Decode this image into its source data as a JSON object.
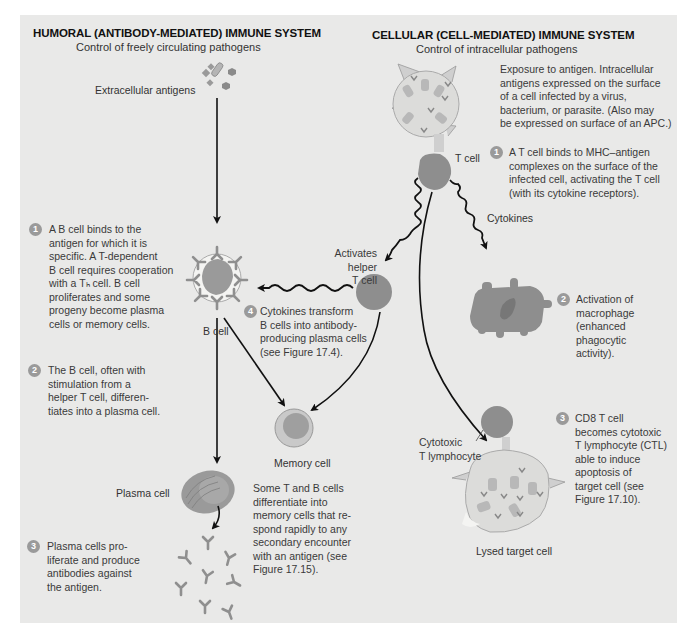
{
  "humoral": {
    "title": "HUMORAL (ANTIBODY-MEDIATED) IMMUNE SYSTEM",
    "subtitle": "Control of freely circulating pathogens",
    "antigens_label": "Extracellular antigens",
    "b_cell_label": "B cell",
    "plasma_cell_label": "Plasma cell",
    "memory_cell_label": "Memory cell",
    "steps": [
      {
        "num": "1",
        "text": [
          "A B cell binds to the",
          "antigen for which it is",
          "specific. A T-dependent",
          "B cell requires cooperation",
          "with a Tₕ cell. B cell",
          "proliferates and some",
          "progeny become plasma",
          "cells or memory cells."
        ]
      },
      {
        "num": "2",
        "text": [
          "The B cell, often with",
          "stimulation from a",
          "helper T cell, differen-",
          "tiates into a plasma cell."
        ]
      },
      {
        "num": "3",
        "text": [
          "Plasma cells pro-",
          "liferate and produce",
          "antibodies against",
          "the antigen."
        ]
      },
      {
        "num": "4",
        "text": [
          "Cytokines transform",
          "B cells into antibody-",
          "producing plasma cells",
          "(see Figure 17.4)."
        ]
      }
    ],
    "memory_note": [
      "Some T and B cells",
      "differentiate into",
      "memory cells that re-",
      "spond rapidly to any",
      "secondary encounter",
      "with an antigen (see",
      "Figure 17.15)."
    ],
    "helper_label": [
      "Activates",
      "helper",
      "T cell"
    ]
  },
  "cellular": {
    "title": "CELLULAR (CELL-MEDIATED) IMMUNE SYSTEM",
    "subtitle": "Control of intracellular pathogens",
    "exposure_note": [
      "Exposure to antigen. Intracellular",
      "antigens expressed on the surface",
      "of a cell infected by a virus,",
      "bacterium, or parasite. (Also may",
      "be expressed on surface of an APC.)"
    ],
    "t_cell_label": "T cell",
    "cytokines_label": "Cytokines",
    "ctl_label": [
      "Cytotoxic",
      "T lymphocyte"
    ],
    "lysed_label": "Lysed target cell",
    "steps": [
      {
        "num": "1",
        "text": [
          "A T cell binds to MHC–antigen",
          "complexes on the surface of the",
          "infected cell, activating the T cell",
          "(with its cytokine receptors)."
        ]
      },
      {
        "num": "2",
        "text": [
          "Activation of",
          "macrophage",
          "(enhanced",
          "phagocytic",
          "activity)."
        ]
      },
      {
        "num": "3",
        "text": [
          "CD8 T cell",
          "becomes cytotoxic",
          "T lymphocyte (CTL)",
          "able to induce",
          "apoptosis of",
          "target cell (see",
          "Figure 17.10)."
        ]
      }
    ]
  },
  "colors": {
    "panel_bg": "#e9e9e8",
    "cell_dark": "#8c8c8c",
    "cell_light": "#c9c9c9",
    "step_badge": "#9a9a9a",
    "arrow": "#111111"
  }
}
